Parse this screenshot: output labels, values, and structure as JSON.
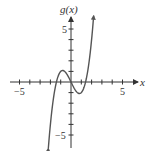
{
  "chart_data": {
    "type": "line",
    "title": "",
    "xlabel": "x",
    "ylabel": "g(x)",
    "xlim": [
      -5.5,
      6.5
    ],
    "ylim": [
      -6.5,
      6.5
    ],
    "x_ticks": [
      -5,
      -4,
      -3,
      -2,
      -1,
      1,
      2,
      3,
      4,
      5
    ],
    "y_ticks": [
      -5,
      -4,
      -3,
      -2,
      -1,
      1,
      2,
      3,
      4,
      5
    ],
    "x_tick_labels": {
      "-5": "−5",
      "5": "5"
    },
    "y_tick_labels": {
      "-5": "−5",
      "5": "5"
    },
    "grid": false,
    "legend": null,
    "series": [
      {
        "name": "g(x)",
        "function_estimate": "x^3 - 2x",
        "domain": [
          -2.2,
          2.2
        ],
        "arrows_at_ends": true,
        "key_points": [
          {
            "x": -2.2,
            "y": -6.2,
            "note": "lower end (arrow)"
          },
          {
            "x": -1.41,
            "y": 0,
            "note": "x-intercept"
          },
          {
            "x": -0.82,
            "y": 1.09,
            "note": "local maximum"
          },
          {
            "x": 0,
            "y": 0,
            "note": "x-intercept / origin"
          },
          {
            "x": 0.82,
            "y": -1.09,
            "note": "local minimum"
          },
          {
            "x": 1.41,
            "y": 0,
            "note": "x-intercept"
          },
          {
            "x": 2.2,
            "y": 6.2,
            "note": "upper end (arrow)"
          }
        ]
      }
    ]
  },
  "labels": {
    "y_axis": "g(x)",
    "x_axis": "x",
    "x_neg5": "−5",
    "x_pos5": "5",
    "y_pos5": "5",
    "y_neg5": "−5"
  },
  "colors": {
    "axis": "#333333",
    "curve": "#555555",
    "background": "#ffffff"
  }
}
